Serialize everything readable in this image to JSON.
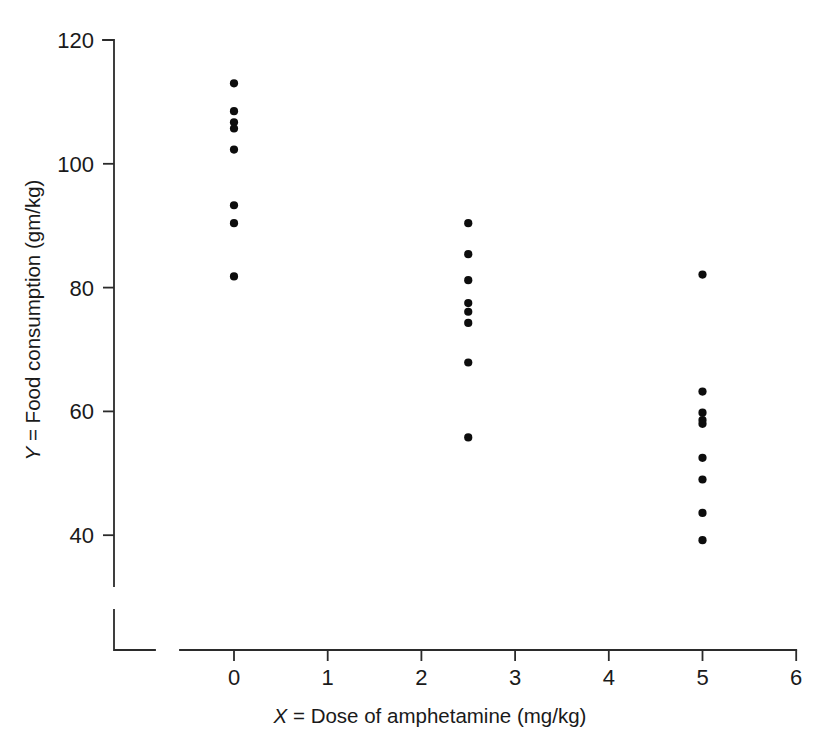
{
  "chart_data": {
    "type": "scatter",
    "title": "",
    "xlabel": "X = Dose of amphetamine (mg/kg)",
    "xlabel_var": "X",
    "xlabel_rest": " = Dose of amphetamine (mg/kg)",
    "ylabel": "Y = Food consumption (gm/kg)",
    "ylabel_var": "Y",
    "ylabel_rest": " = Food consumption (gm/kg)",
    "xlim": [
      0,
      6
    ],
    "ylim": [
      34,
      122
    ],
    "grid": false,
    "legend": "none",
    "xticks": [
      0,
      1,
      2,
      3,
      4,
      5,
      6
    ],
    "xtick_labels": [
      "0",
      "1",
      "2",
      "3",
      "4",
      "5",
      "6"
    ],
    "yticks": [
      40,
      60,
      80,
      100,
      120
    ],
    "ytick_labels": [
      "40",
      "60",
      "80",
      "100",
      "120"
    ],
    "axis_break": true,
    "marker": "filled-circle",
    "marker_color": "#0d0d0d",
    "marker_size_px": 7,
    "x": [
      0,
      0,
      0,
      0,
      0,
      0,
      0,
      0,
      2.5,
      2.5,
      2.5,
      2.5,
      2.5,
      2.5,
      2.5,
      2.5,
      5,
      5,
      5,
      5,
      5,
      5,
      5,
      5
    ],
    "y": [
      113,
      108.5,
      106.7,
      105.7,
      102.3,
      93.3,
      90.4,
      81.8,
      90.4,
      85.4,
      81.2,
      77.5,
      76.1,
      74.3,
      67.9,
      55.8,
      82.1,
      63.2,
      59.8,
      58.6,
      58.0,
      52.5,
      49.0,
      43.6
    ],
    "groups": [
      {
        "dose": 0,
        "label": "0 mg/kg",
        "values": [
          113,
          108.5,
          106.7,
          105.7,
          102.3,
          93.3,
          90.4,
          81.8
        ]
      },
      {
        "dose": 2.5,
        "label": "2.5 mg/kg",
        "values": [
          90.4,
          85.4,
          81.2,
          77.5,
          76.1,
          74.3,
          67.9,
          55.8
        ]
      },
      {
        "dose": 5,
        "label": "5 mg/kg",
        "values": [
          82.1,
          63.2,
          59.8,
          58.6,
          58.0,
          52.5,
          49.0,
          43.6,
          39.2
        ]
      }
    ]
  }
}
